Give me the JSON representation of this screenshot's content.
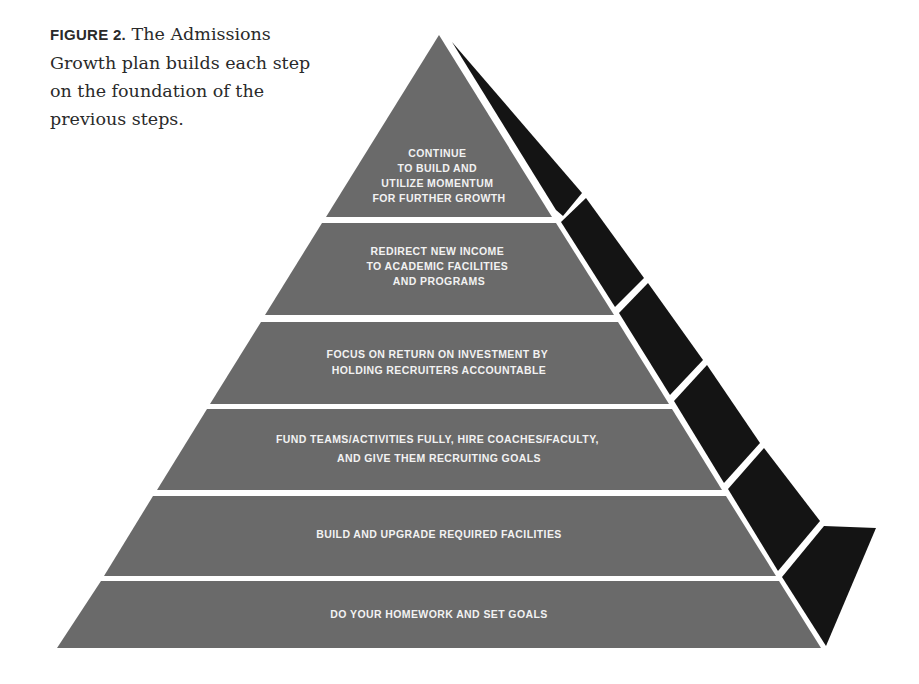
{
  "caption": {
    "label": "FIGURE 2.",
    "text": " The Admissions Growth plan builds each step on the foundation of the previous steps."
  },
  "colors": {
    "front_face": "#6a6a6a",
    "side_face": "#141414",
    "separator": "#ffffff",
    "label_text": "#f2f2f2"
  },
  "pyramid": {
    "levels": [
      {
        "lines": [
          "CONTINUE",
          "TO BUILD AND",
          "UTILIZE MOMENTUM",
          "FOR FURTHER GROWTH"
        ]
      },
      {
        "lines": [
          "REDIRECT NEW INCOME",
          "TO ACADEMIC FACILITIES",
          "AND PROGRAMS"
        ]
      },
      {
        "lines": [
          "FOCUS ON RETURN ON INVESTMENT BY",
          "HOLDING RECRUITERS ACCOUNTABLE"
        ]
      },
      {
        "lines": [
          "FUND TEAMS/ACTIVITIES FULLY, HIRE COACHES/FACULTY,",
          "AND GIVE THEM RECRUITING GOALS"
        ]
      },
      {
        "lines": [
          "BUILD AND UPGRADE REQUIRED FACILITIES"
        ]
      },
      {
        "lines": [
          "DO YOUR HOMEWORK AND SET GOALS"
        ]
      }
    ]
  }
}
